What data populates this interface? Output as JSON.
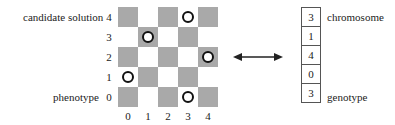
{
  "labels": {
    "candidate_solution": "candidate solution",
    "phenotype": "phenotype",
    "chromosome": "chromosome",
    "genotype": "genotype"
  },
  "board": {
    "size": 5,
    "row_labels": [
      "4",
      "3",
      "2",
      "1",
      "0"
    ],
    "col_labels": [
      "0",
      "1",
      "2",
      "3",
      "4"
    ],
    "queens": [
      {
        "row": 4,
        "col": 3
      },
      {
        "row": 3,
        "col": 1
      },
      {
        "row": 2,
        "col": 4
      },
      {
        "row": 1,
        "col": 0
      },
      {
        "row": 0,
        "col": 3
      }
    ],
    "colors": {
      "dark": "#a9a9a9",
      "light": "#ffffff"
    }
  },
  "chromosome": {
    "genes": [
      "3",
      "1",
      "4",
      "0",
      "3"
    ]
  },
  "arrow": {
    "type": "bidirectional",
    "icon": "double-arrow-icon"
  }
}
